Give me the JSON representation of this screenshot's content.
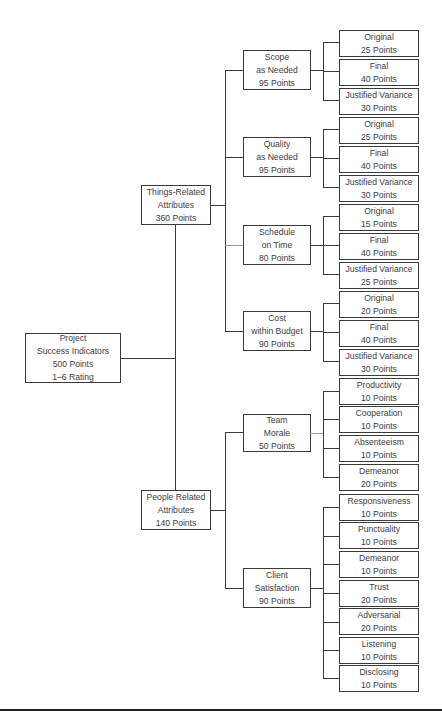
{
  "diagram": {
    "type": "hierarchy-tree",
    "root": {
      "lines": [
        "Project",
        "Success Indicators",
        "500 Points",
        "1–6 Rating"
      ]
    },
    "groups": [
      {
        "lines": [
          "Things-Related",
          "Attributes",
          "360 Points"
        ],
        "categories": [
          {
            "lines": [
              "Scope",
              "as Needed",
              "95 Points"
            ],
            "leaves": [
              {
                "name": "Original",
                "points": "25 Points"
              },
              {
                "name": "Final",
                "points": "40 Points"
              },
              {
                "name": "Justified Variance",
                "points": "30 Points"
              }
            ]
          },
          {
            "lines": [
              "Quality",
              "as Needed",
              "95 Points"
            ],
            "leaves": [
              {
                "name": "Original",
                "points": "25 Points"
              },
              {
                "name": "Final",
                "points": "40 Points"
              },
              {
                "name": "Justified Variance",
                "points": "30 Points"
              }
            ]
          },
          {
            "lines": [
              "Schedule",
              "on Time",
              "80 Points"
            ],
            "leaves": [
              {
                "name": "Original",
                "points": "15 Points"
              },
              {
                "name": "Final",
                "points": "40 Points"
              },
              {
                "name": "Justified Variance",
                "points": "25 Points"
              }
            ]
          },
          {
            "lines": [
              "Cost",
              "within Budget",
              "90 Points"
            ],
            "leaves": [
              {
                "name": "Original",
                "points": "20 Points"
              },
              {
                "name": "Final",
                "points": "40 Points"
              },
              {
                "name": "Justified Variance",
                "points": "30 Points"
              }
            ]
          }
        ]
      },
      {
        "lines": [
          "People Related",
          "Attributes",
          "140 Points"
        ],
        "categories": [
          {
            "lines": [
              "Team",
              "Morale",
              "50 Points"
            ],
            "leaves": [
              {
                "name": "Productivity",
                "points": "10 Points"
              },
              {
                "name": "Cooperation",
                "points": "10 Points"
              },
              {
                "name": "Absenteeism",
                "points": "10 Points"
              },
              {
                "name": "Demeanor",
                "points": "20 Points"
              }
            ]
          },
          {
            "lines": [
              "Client",
              "Satisfaction",
              "90 Points"
            ],
            "leaves": [
              {
                "name": "Responsiveness",
                "points": "10 Points"
              },
              {
                "name": "Punctuality",
                "points": "10 Points"
              },
              {
                "name": "Demeanor",
                "points": "10 Points"
              },
              {
                "name": "Trust",
                "points": "20 Points"
              },
              {
                "name": "Adversarial",
                "points": "20 Points"
              },
              {
                "name": "Listening",
                "points": "10 Points"
              },
              {
                "name": "Disclosing",
                "points": "10 Points"
              }
            ]
          }
        ]
      }
    ]
  },
  "colors": {
    "line": "#3a3a3a",
    "text": "#3c3c3c",
    "background": "#ffffff"
  }
}
